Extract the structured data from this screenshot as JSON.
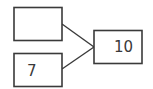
{
  "diagram": {
    "type": "number-bond",
    "parts": [
      {
        "label": ""
      },
      {
        "label": "7"
      }
    ],
    "whole": {
      "label": "10"
    },
    "stroke_color": "#3a3a3a"
  }
}
